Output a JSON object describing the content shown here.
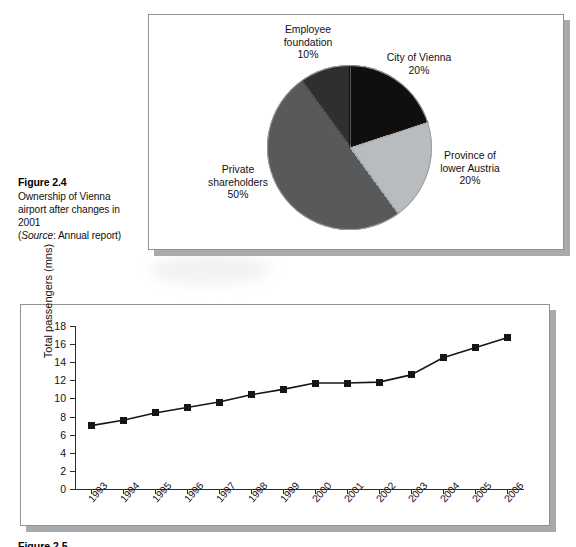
{
  "figure": {
    "number": "Figure 2.4",
    "caption_lines": [
      "Ownership of Vienna",
      "airport after changes in",
      "2001"
    ],
    "source_prefix": "(",
    "source_word": "Source",
    "source_rest": ": Annual report)"
  },
  "bottom_caption": {
    "number": "Figure 2.5"
  },
  "pie": {
    "labels": {
      "employee": {
        "line1": "Employee",
        "line2": "foundation",
        "value": "10%"
      },
      "vienna": {
        "line1": "City of Vienna",
        "value": "20%"
      },
      "province": {
        "line1": "Province of",
        "line2": "lower Austria",
        "value": "20%"
      },
      "private": {
        "line1": "Private",
        "line2": "shareholders",
        "value": "50%"
      }
    }
  },
  "line": {
    "y_axis_title": "Total passengers (mns)"
  },
  "colors": {
    "vienna": "#100f0d",
    "province": "#b9bcbe",
    "private": "#57595b",
    "employee": "#2e2f30",
    "panel_border": "#8e9295",
    "shadow": "#a7abae",
    "ink": "#161616"
  },
  "chart_data": [
    {
      "type": "pie",
      "title": "Ownership of Vienna airport after changes in 2001",
      "labels": [
        "City of Vienna",
        "Province of lower Austria",
        "Private shareholders",
        "Employee foundation"
      ],
      "values": [
        20,
        20,
        50,
        10
      ],
      "value_labels": [
        "20%",
        "20%",
        "50%",
        "10%"
      ],
      "colors": [
        "#100f0d",
        "#b9bcbe",
        "#57595b",
        "#2e2f30"
      ],
      "start_angle_deg": 0,
      "direction": "clockwise",
      "legend": "labels placed outside slices"
    },
    {
      "type": "line",
      "title": "",
      "xlabel": "",
      "ylabel": "Total passengers (mns)",
      "categories": [
        "1993",
        "1994",
        "1995",
        "1996",
        "1997",
        "1998",
        "1999",
        "2000",
        "2001",
        "2002",
        "2003",
        "2004",
        "2005",
        "2006"
      ],
      "values": [
        7.0,
        7.6,
        8.4,
        9.0,
        9.6,
        10.4,
        11.0,
        11.7,
        11.7,
        11.8,
        12.6,
        14.5,
        15.6,
        16.7
      ],
      "yticks": [
        0,
        2,
        4,
        6,
        8,
        10,
        12,
        14,
        16,
        18
      ],
      "ylim": [
        0,
        18
      ],
      "grid": false,
      "marker": "filled-square",
      "legend": "none"
    }
  ]
}
